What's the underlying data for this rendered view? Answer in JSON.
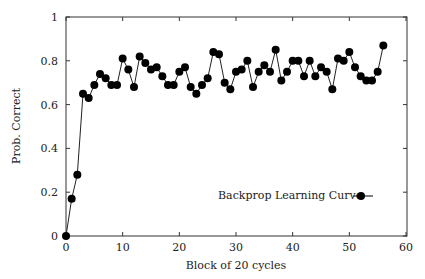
{
  "chart_data": {
    "type": "line",
    "title": "",
    "xlabel": "Block of 20 cycles",
    "ylabel": "Prob. Correct",
    "xlim": [
      0,
      60
    ],
    "ylim": [
      0,
      1
    ],
    "grid": false,
    "legend_position": "lower right (inside)",
    "x_ticks": [
      0,
      10,
      20,
      30,
      40,
      50,
      60
    ],
    "x_tick_labels": [
      "0",
      "10",
      "20",
      "30",
      "40",
      "50",
      "60"
    ],
    "y_ticks": [
      0,
      0.2,
      0.4,
      0.6,
      0.8,
      1
    ],
    "y_tick_labels": [
      "0",
      "0.2",
      "0.4",
      "0.6",
      "0.8",
      "1"
    ],
    "series": [
      {
        "name": "Backprop Learning Curve",
        "marker": "filled-circle",
        "color": "#000000",
        "x": [
          0,
          1,
          2,
          3,
          4,
          5,
          6,
          7,
          8,
          9,
          10,
          11,
          12,
          13,
          14,
          15,
          16,
          17,
          18,
          19,
          20,
          21,
          22,
          23,
          24,
          25,
          26,
          27,
          28,
          29,
          30,
          31,
          32,
          33,
          34,
          35,
          36,
          37,
          38,
          39,
          40,
          41,
          42,
          43,
          44,
          45,
          46,
          47,
          48,
          49,
          50,
          51,
          52,
          53,
          54,
          55,
          56
        ],
        "values": [
          0,
          0.17,
          0.28,
          0.65,
          0.63,
          0.69,
          0.74,
          0.72,
          0.69,
          0.69,
          0.81,
          0.76,
          0.68,
          0.82,
          0.79,
          0.76,
          0.77,
          0.73,
          0.69,
          0.69,
          0.75,
          0.77,
          0.68,
          0.65,
          0.69,
          0.72,
          0.84,
          0.83,
          0.7,
          0.67,
          0.75,
          0.76,
          0.8,
          0.68,
          0.75,
          0.78,
          0.75,
          0.85,
          0.71,
          0.75,
          0.8,
          0.8,
          0.73,
          0.8,
          0.73,
          0.77,
          0.75,
          0.67,
          0.81,
          0.8,
          0.84,
          0.77,
          0.73,
          0.71,
          0.71,
          0.75,
          0.87
        ]
      }
    ]
  },
  "labels": {
    "xlabel": "Block of 20 cycles",
    "ylabel": "Prob. Correct",
    "legend": "Backprop Learning Curve"
  }
}
